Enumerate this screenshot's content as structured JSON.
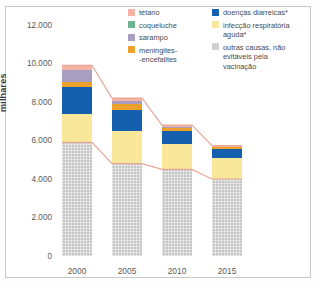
{
  "chart_data": {
    "type": "bar",
    "subtype": "stacked-bar-with-connectors",
    "title": "",
    "xlabel": "",
    "ylabel": "milhares",
    "categories": [
      "2000",
      "2005",
      "2010",
      "2015"
    ],
    "ylim": [
      0,
      12000
    ],
    "yticks": [
      0,
      2000,
      4000,
      6000,
      8000,
      10000,
      12000
    ],
    "ytick_labels": [
      "0",
      "2.000",
      "4.000",
      "6.000",
      "8.000",
      "10.000",
      "12.000"
    ],
    "grid": false,
    "legend_position": "top-right",
    "stack_order_bottom_to_top": [
      "outras causas, não evitáveis pela vacinação",
      "infecção respiratória aguda*",
      "doenças diarreicas*",
      "meningites--encefalites",
      "sarampo",
      "coqueluche",
      "tétano"
    ],
    "series": [
      {
        "name": "outras causas, não evitáveis pela vacinação",
        "color": "#c6c6c6",
        "values": [
          5900,
          4800,
          4500,
          4000
        ]
      },
      {
        "name": "infecção respiratória aguda*",
        "color": "#fae89a",
        "values": [
          1500,
          1700,
          1300,
          1100
        ]
      },
      {
        "name": "doenças diarreicas*",
        "color": "#1560ae",
        "values": [
          1400,
          1100,
          700,
          450
        ]
      },
      {
        "name": "meningites--encefalites",
        "color": "#eda12a",
        "values": [
          250,
          300,
          150,
          100
        ]
      },
      {
        "name": "sarampo",
        "color": "#a89ec2",
        "values": [
          600,
          150,
          50,
          0
        ]
      },
      {
        "name": "coqueluche",
        "color": "#6cb58e",
        "values": [
          0,
          0,
          0,
          0
        ]
      },
      {
        "name": "tétano",
        "color": "#f4b3a3",
        "values": [
          250,
          150,
          100,
          80
        ]
      }
    ],
    "totals": [
      9900,
      8200,
      6800,
      5730
    ],
    "annotations": [
      "linha conectora rosa ligando o topo das barras",
      "linha conectora rosa ligando o topo do segmento cinza"
    ]
  },
  "legend": {
    "columns": [
      {
        "items": [
          {
            "label": "tétano",
            "color": "#f4b3a3",
            "swatch_name": "legend-swatch-tetano"
          },
          {
            "label": "coqueluche",
            "color": "#6cb58e",
            "swatch_name": "legend-swatch-coqueluche"
          },
          {
            "label": "sarampo",
            "color": "#a89ec2",
            "swatch_name": "legend-swatch-sarampo"
          },
          {
            "label": "meningites-\n-encefalites",
            "color": "#eda12a",
            "swatch_name": "legend-swatch-meningites"
          }
        ]
      },
      {
        "items": [
          {
            "label": "doenças diarreicas*",
            "color": "#1560ae",
            "swatch_name": "legend-swatch-diarreicas"
          },
          {
            "label": "infecção respiratória\naguda*",
            "color": "#fae89a",
            "swatch_name": "legend-swatch-respiratoria"
          },
          {
            "label": "outras causas, não\nevitáveis pela\nvacinação",
            "color": "#d0d0d0",
            "swatch_name": "legend-swatch-outras"
          }
        ]
      }
    ]
  },
  "axis": {
    "y_title": "milhares",
    "y_labels": [
      "12.000",
      "10.000",
      "8.000",
      "6.000",
      "4.000",
      "2.000",
      "0"
    ],
    "x_labels": [
      "2000",
      "2005",
      "2010",
      "2015"
    ]
  },
  "colors": {
    "connector": "#e8a899",
    "frame": "#c9c9c9",
    "text": "#4a4a4a"
  }
}
